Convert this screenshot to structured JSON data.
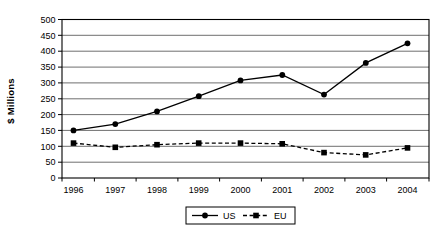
{
  "chart_data": {
    "type": "line",
    "title": "",
    "xlabel": "",
    "ylabel": "$ Millions",
    "categories": [
      "1996",
      "1997",
      "1998",
      "1999",
      "2000",
      "2001",
      "2002",
      "2003",
      "2004"
    ],
    "series": [
      {
        "name": "US",
        "values": [
          150,
          170,
          210,
          258,
          308,
          325,
          263,
          363,
          425
        ],
        "line_style": "solid",
        "marker": "circle",
        "color": "#000000"
      },
      {
        "name": "EU",
        "values": [
          110,
          97,
          105,
          110,
          110,
          108,
          80,
          73,
          95
        ],
        "line_style": "dashed",
        "marker": "square",
        "color": "#000000"
      }
    ],
    "ylim": [
      0,
      500
    ],
    "yticks": [
      0,
      50,
      100,
      150,
      200,
      250,
      300,
      350,
      400,
      450,
      500
    ],
    "grid": true,
    "legend_position": "bottom-center",
    "colors": {
      "line": "#000000",
      "grid": "#4a4a4a",
      "axis": "#000000",
      "text": "#000000",
      "background": "#ffffff",
      "legend_border": "#000000"
    }
  }
}
